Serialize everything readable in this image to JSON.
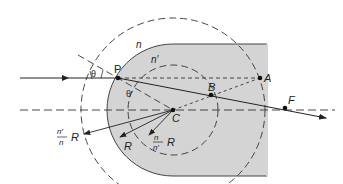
{
  "diagram": {
    "type": "optics-refraction-spherical-surface",
    "labels": {
      "P": "P",
      "A": "A",
      "B": "B",
      "C": "C",
      "F": "F",
      "n": "n",
      "n_prime": "n′",
      "theta": "θ",
      "theta_prime": "θ′",
      "R": "R",
      "outer_frac_num": "n′",
      "outer_frac_den": "n",
      "outer_R": "R",
      "inner_frac_num": "n",
      "inner_frac_den": "n′",
      "inner_R": "R"
    },
    "colors": {
      "glass_fill": "#d4d4d4",
      "line": "#222222"
    }
  }
}
